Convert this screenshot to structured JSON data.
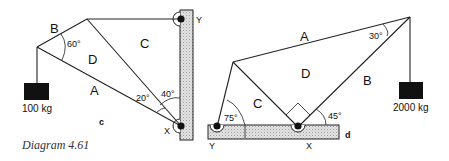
{
  "caption": "Diagram 4.61",
  "diagram_c": {
    "tag": "c",
    "member_labels": {
      "A": "A",
      "B": "B",
      "C": "C",
      "D": "D"
    },
    "angles": {
      "at_left_node": "60°",
      "at_x_inner": "20°",
      "at_x_wall": "40°"
    },
    "support_labels": {
      "top": "Y",
      "bottom": "X"
    },
    "load": "100 kg"
  },
  "diagram_d": {
    "tag": "d",
    "member_labels": {
      "A": "A",
      "B": "B",
      "C": "C",
      "D": "D"
    },
    "angles": {
      "at_y": "75°",
      "at_top_right": "30°",
      "at_x": "45°"
    },
    "support_labels": {
      "left": "Y",
      "right": "X"
    },
    "load": "2000 kg"
  },
  "colors": {
    "ink": "#222222",
    "weight": "#111111",
    "hatch": "#cfcfcf",
    "pin": "#111111"
  }
}
